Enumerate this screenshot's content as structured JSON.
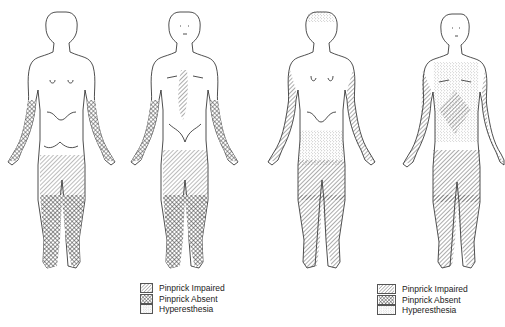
{
  "figures": [
    {
      "id": "patient-a-posterior",
      "view": "posterior"
    },
    {
      "id": "patient-a-anterior",
      "view": "anterior"
    },
    {
      "id": "patient-b-posterior",
      "view": "posterior"
    },
    {
      "id": "patient-b-anterior",
      "view": "anterior"
    }
  ],
  "legends": [
    {
      "items": [
        {
          "label": "Pinprick Impaired",
          "pattern": "diagonal-hatch"
        },
        {
          "label": "Pinprick Absent",
          "pattern": "cross-hatch"
        },
        {
          "label": "Hyperesthesia",
          "pattern": "stipple"
        }
      ]
    },
    {
      "items": [
        {
          "label": "Pinprick Impaired",
          "pattern": "diagonal-hatch"
        },
        {
          "label": "Pinprick Absent",
          "pattern": "cross-hatch"
        },
        {
          "label": "Hyperesthesia",
          "pattern": "stipple"
        }
      ]
    }
  ],
  "colors": {
    "ink": "#222222",
    "background": "#ffffff"
  }
}
